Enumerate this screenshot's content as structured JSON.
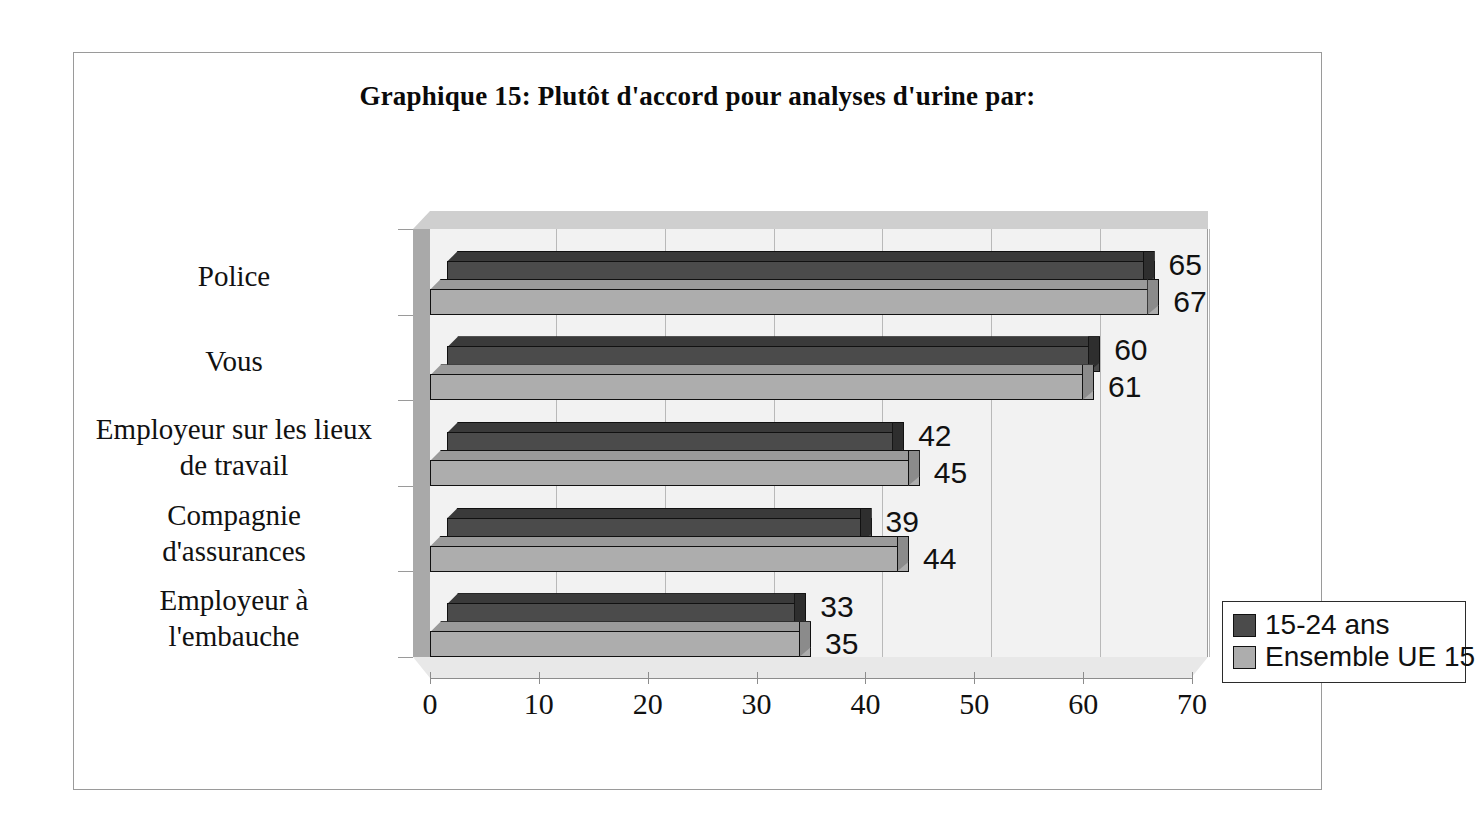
{
  "figure": {
    "title": "Graphique 15: Plutôt d'accord pour analyses d'urine par:"
  },
  "legend": {
    "position": "inside-lower-right",
    "items": [
      {
        "label": "15-24 ans",
        "color": "#4b4b4b"
      },
      {
        "label": "Ensemble UE 15",
        "color": "#adadad"
      }
    ]
  },
  "axis": {
    "x_ticks": [
      "0",
      "10",
      "20",
      "30",
      "40",
      "50",
      "60",
      "70"
    ]
  },
  "colors": {
    "series_1": "#4b4b4b",
    "series_2": "#adadad",
    "plot_background": "#f2f2f2",
    "side_wall": "#a9a9a9",
    "floor": "#e8e8e8",
    "gridline": "#b9b9b9",
    "outline": "#111111",
    "frame_border": "#9a9a9a"
  },
  "chart_data": {
    "type": "bar",
    "orientation": "horizontal",
    "style": "3d",
    "title": "Graphique 15: Plutôt d'accord pour analyses d'urine par:",
    "xlabel": "",
    "ylabel": "",
    "xlim": [
      0,
      70
    ],
    "xticks": [
      0,
      10,
      20,
      30,
      40,
      50,
      60,
      70
    ],
    "grid": true,
    "legend_position": "inside lower right",
    "categories": [
      "Police",
      "Vous",
      "Employeur sur les lieux de travail",
      "Compagnie d'assurances",
      "Employeur à l'embauche"
    ],
    "category_lines": [
      [
        "Police"
      ],
      [
        "Vous"
      ],
      [
        "Employeur sur les lieux",
        "de travail"
      ],
      [
        "Compagnie",
        "d'assurances"
      ],
      [
        "Employeur à",
        "l'embauche"
      ]
    ],
    "series": [
      {
        "name": "15-24 ans",
        "color": "#4b4b4b",
        "values": [
          65,
          60,
          42,
          39,
          33
        ]
      },
      {
        "name": "Ensemble UE 15",
        "color": "#adadad",
        "values": [
          67,
          61,
          45,
          44,
          35
        ]
      }
    ]
  }
}
